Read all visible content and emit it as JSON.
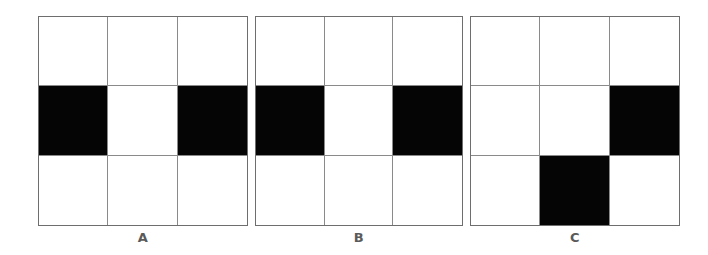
{
  "figure": {
    "panels": [
      {
        "label": "A",
        "rows": 3,
        "cols": 3,
        "cells": [
          [
            0,
            0,
            0
          ],
          [
            1,
            0,
            1
          ],
          [
            0,
            0,
            0
          ]
        ]
      },
      {
        "label": "B",
        "rows": 3,
        "cols": 3,
        "cells": [
          [
            0,
            0,
            0
          ],
          [
            1,
            0,
            1
          ],
          [
            0,
            0,
            0
          ]
        ]
      },
      {
        "label": "C",
        "rows": 3,
        "cols": 3,
        "cells": [
          [
            0,
            0,
            0
          ],
          [
            0,
            0,
            1
          ],
          [
            0,
            1,
            0
          ]
        ]
      }
    ],
    "colors": {
      "filled": "#050505",
      "empty": "#ffffff",
      "gridline": "#8a8a8a",
      "label": "#5a5a5a"
    }
  }
}
